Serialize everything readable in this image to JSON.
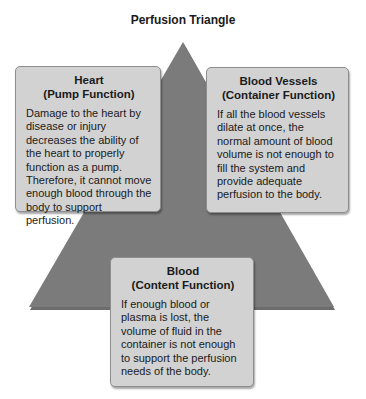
{
  "title": "Perfusion Triangle",
  "colors": {
    "triangle_fill": "#7b7b7b",
    "box_fill": "#d2d2d2",
    "box_border": "#8e8e8e"
  },
  "boxes": {
    "heart": {
      "heading_line1": "Heart",
      "heading_line2": "(Pump Function)",
      "body": "Damage to the heart by disease or injury decreases the ability of the heart to properly function as a pump. Therefore, it cannot move enough blood through the body to support perfusion."
    },
    "vessels": {
      "heading_line1": "Blood Vessels",
      "heading_line2": "(Container Function)",
      "body": "If all the blood vessels dilate at once, the normal amount of blood volume is not enough to fill the system and provide adequate perfusion to the body."
    },
    "blood": {
      "heading_line1": "Blood",
      "heading_line2": "(Content Function)",
      "body": "If enough blood or plasma is lost, the volume of fluid in the container is not enough to support the perfusion needs of the body."
    }
  }
}
